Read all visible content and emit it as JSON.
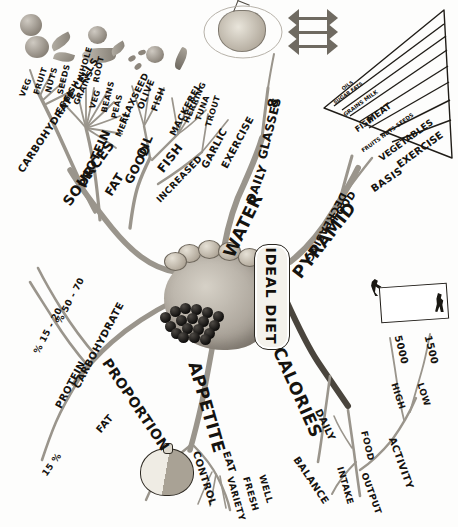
{
  "document": {
    "title": "IDEAL DIET",
    "corner_note": "Summary Mind Map® of Chapter 4",
    "type": "hand-drawn mind map"
  },
  "center": {
    "label": "IDEAL DIET",
    "imagery": [
      "face-head-drawing",
      "grapes",
      "potatoes"
    ]
  },
  "branches": [
    {
      "name": "SOURCES",
      "children": [
        {
          "name": "CARBOHYDRATE CELLS",
          "children": [
            {
              "name": "VEG"
            },
            {
              "name": "FRUIT"
            },
            {
              "name": "NUTS"
            },
            {
              "name": "SEEDS"
            }
          ]
        },
        {
          "name": "PROTEIN",
          "children": [
            {
              "name": "EGGS"
            },
            {
              "name": "FISH"
            },
            {
              "name": "GRAINS"
            },
            {
              "name": "WHOLE"
            },
            {
              "name": "ROOT"
            },
            {
              "name": "VEG"
            },
            {
              "name": "BEANS"
            },
            {
              "name": "PEAS"
            },
            {
              "name": "MEAT"
            }
          ]
        },
        {
          "name": "FAT",
          "children": [
            {
              "name": "GOOD OIL",
              "children": [
                {
                  "name": "FLAXSEED"
                },
                {
                  "name": "OLIVE"
                },
                {
                  "name": "FISH"
                }
              ]
            },
            {
              "name": "FISH",
              "children": [
                {
                  "name": "MACKEREL"
                },
                {
                  "name": "HERRING"
                },
                {
                  "name": "TUNA"
                },
                {
                  "name": "TROUT"
                }
              ]
            },
            {
              "name": "INCREASED",
              "children": [
                {
                  "name": "GARLIC"
                },
                {
                  "name": "EXERCISE"
                }
              ]
            }
          ]
        }
      ]
    },
    {
      "name": "WATER",
      "children": [
        {
          "name": "DAILY"
        },
        {
          "name": "GLASSES"
        },
        {
          "name": "8"
        }
      ]
    },
    {
      "name": "PYRAMID",
      "children": [
        {
          "name": "FOOD"
        },
        {
          "name": "DECREASING"
        },
        {
          "name": "BASIS"
        }
      ]
    },
    {
      "name": "PROPORTION",
      "children": [
        {
          "name": "PROTEIN",
          "value": "% 15 - 20"
        },
        {
          "name": "CARBOHYDRATE",
          "value": "% 50 - 70"
        },
        {
          "name": "FAT",
          "value": "15 %"
        }
      ]
    },
    {
      "name": "APPETITE",
      "children": [
        {
          "name": "CONTROL"
        },
        {
          "name": "EAT",
          "children": [
            {
              "name": "VARIETY"
            },
            {
              "name": "FRESH"
            },
            {
              "name": "WELL"
            }
          ]
        }
      ]
    },
    {
      "name": "CALORIES",
      "children": [
        {
          "name": "DAILY"
        },
        {
          "name": "BALANCE",
          "children": [
            {
              "name": "INTAKE",
              "children": [
                {
                  "name": "FOOD"
                }
              ]
            },
            {
              "name": "OUTPUT",
              "children": [
                {
                  "name": "ACTIVITY",
                  "children": [
                    {
                      "name": "HIGH",
                      "value": "5000"
                    },
                    {
                      "name": "LOW",
                      "value": "1500"
                    }
                  ]
                }
              ]
            }
          ]
        }
      ]
    }
  ],
  "pyramid": {
    "caption_left": "DECREASING",
    "caption_bottom": "BASIS",
    "layers": [
      "OILS",
      "SUGAR  FATS",
      "GRAINS MILK",
      "FISH",
      "MEAT",
      "FRUITS  NUTS  SEEDS",
      "VEGETABLES",
      "EXERCISE"
    ]
  },
  "labels": {
    "sources": "SOURCES",
    "carbohydrate_cells": "CARBOHYDRATE CELLS",
    "veg1": "VEG",
    "fruit": "FRUIT",
    "nuts": "NUTS",
    "seeds": "SEEDS",
    "protein": "PROTEIN",
    "eggs": "EGGS",
    "fish_p": "FISH",
    "grains": "GRAINS",
    "whole": "WHOLE",
    "root": "ROOT",
    "veg2": "VEG",
    "beans": "BEANS",
    "peas": "PEAS",
    "meat": "MEAT",
    "fat": "FAT",
    "good": "GOOD",
    "oil": "OIL",
    "flaxseed": "FLAXSEED",
    "olive": "OLIVE",
    "fish_o": "FISH",
    "fish_b": "FISH",
    "mackerel": "MACKEREL",
    "herring": "HERRING",
    "tuna": "TUNA",
    "trout": "TROUT",
    "increased": "INCREASED",
    "garlic": "GARLIC",
    "exercise": "EXERCISE",
    "water": "WATER",
    "daily_w": "DAILY",
    "glasses": "GLASSES",
    "eight": "8",
    "pyramid": "PYRAMID",
    "food_p": "FOOD",
    "decreasing": "DECREASING",
    "basis": "BASIS",
    "proportion": "PROPORTION",
    "protein_p": "PROTEIN",
    "pct1": "% 15 - 20",
    "carbohydrate_p": "CARBOHYDRATE",
    "pct2": "% 50 - 70",
    "fat_p": "FAT",
    "pct3": "15 %",
    "appetite": "APPETITE",
    "control": "CONTROL",
    "eat": "EAT",
    "variety": "VARIETY",
    "fresh": "FRESH",
    "well": "WELL",
    "calories": "CALORIES",
    "daily_c": "DAILY",
    "balance": "BALANCE",
    "intake": "INTAKE",
    "food_c": "FOOD",
    "output": "OUTPUT",
    "activity": "ACTIVITY",
    "high": "HIGH",
    "n5000": "5000",
    "low": "LOW",
    "n1500": "1500"
  },
  "colors": {
    "ink": "#15130f",
    "paper": "#fdfdfc",
    "branch_gray": "#9a958c",
    "branch_dark": "#4a453d"
  }
}
